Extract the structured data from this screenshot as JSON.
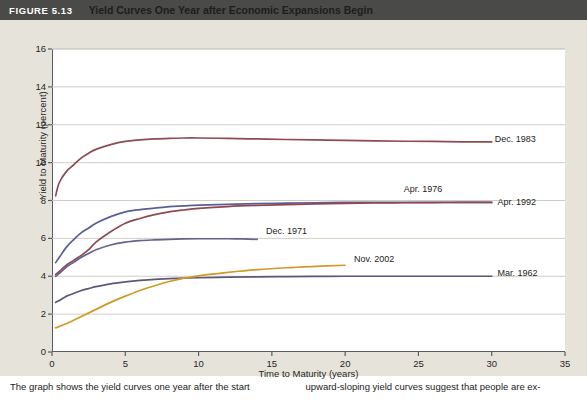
{
  "header": {
    "figure_number": "FIGURE 5.13",
    "title": "Yield Curves One Year after Economic Expansions Begin",
    "bar_color": "#4a4a48"
  },
  "caption": {
    "left": "The graph shows the yield curves one year after the start",
    "right": "upward-sloping yield curves suggest that people are ex-"
  },
  "chart_data": {
    "type": "line",
    "title": "Yield Curves One Year after Economic Expansions Begin",
    "xlabel": "Time to Maturity (years)",
    "ylabel": "Yield to Maturity (percent)",
    "xlim": [
      0,
      35
    ],
    "ylim": [
      0,
      16
    ],
    "xticks": [
      0,
      5,
      10,
      15,
      20,
      25,
      30,
      35
    ],
    "yticks": [
      0,
      2,
      4,
      6,
      8,
      10,
      12,
      14,
      16
    ],
    "grid": "horizontal",
    "legend": "inline-labels",
    "series": [
      {
        "name": "Dec. 1983",
        "color": "#8d4a52",
        "label_x": 30.2,
        "label_y": 11.2,
        "x": [
          0.25,
          0.5,
          1,
          1.5,
          2,
          2.5,
          3,
          4,
          5,
          6,
          7,
          8,
          9,
          10,
          12,
          14,
          16,
          18,
          20,
          22,
          24,
          26,
          28,
          30
        ],
        "y": [
          8.25,
          8.95,
          9.55,
          9.9,
          10.25,
          10.5,
          10.7,
          10.95,
          11.12,
          11.2,
          11.25,
          11.28,
          11.3,
          11.3,
          11.28,
          11.25,
          11.22,
          11.2,
          11.18,
          11.15,
          11.13,
          11.12,
          11.1,
          11.1
        ]
      },
      {
        "name": "Apr. 1976",
        "color": "#5b5f96",
        "label_x": 24.0,
        "label_y": 8.55,
        "x": [
          0.25,
          0.5,
          1,
          1.5,
          2,
          2.5,
          3,
          4,
          5,
          6,
          7,
          8,
          9,
          10,
          12,
          14,
          16,
          18,
          20,
          22,
          24,
          26,
          28,
          30
        ],
        "y": [
          4.72,
          5.0,
          5.55,
          5.95,
          6.3,
          6.55,
          6.8,
          7.15,
          7.4,
          7.52,
          7.6,
          7.68,
          7.72,
          7.76,
          7.8,
          7.84,
          7.86,
          7.88,
          7.9,
          7.9,
          7.9,
          7.9,
          7.9,
          7.9
        ]
      },
      {
        "name": "Apr. 1992",
        "color": "#8d4a52",
        "label_x": 30.4,
        "label_y": 7.85,
        "x": [
          0.25,
          0.5,
          1,
          1.5,
          2,
          2.5,
          3,
          4,
          5,
          6,
          7,
          8,
          9,
          10,
          12,
          14,
          16,
          18,
          20,
          22,
          24,
          26,
          28,
          30
        ],
        "y": [
          4.1,
          4.25,
          4.6,
          4.85,
          5.1,
          5.4,
          5.8,
          6.35,
          6.8,
          7.05,
          7.25,
          7.4,
          7.5,
          7.58,
          7.68,
          7.74,
          7.78,
          7.82,
          7.85,
          7.87,
          7.88,
          7.89,
          7.9,
          7.9
        ]
      },
      {
        "name": "Dec. 1971",
        "color": "#6a5f8e",
        "label_x": 14.6,
        "label_y": 6.35,
        "x": [
          0.25,
          0.5,
          1,
          1.5,
          2,
          2.5,
          3,
          4,
          5,
          6,
          7,
          8,
          9,
          10,
          11,
          12,
          13,
          14
        ],
        "y": [
          4.0,
          4.15,
          4.5,
          4.75,
          5.0,
          5.2,
          5.4,
          5.65,
          5.8,
          5.88,
          5.92,
          5.95,
          5.97,
          5.98,
          5.98,
          5.98,
          5.97,
          5.95
        ]
      },
      {
        "name": "Mar. 1962",
        "color": "#5c5878",
        "label_x": 30.4,
        "label_y": 4.1,
        "x": [
          0.25,
          0.5,
          1,
          1.5,
          2,
          2.5,
          3,
          4,
          5,
          6,
          7,
          8,
          9,
          10,
          12,
          14,
          16,
          18,
          20,
          22,
          24,
          26,
          28,
          30
        ],
        "y": [
          2.62,
          2.72,
          2.95,
          3.1,
          3.25,
          3.35,
          3.45,
          3.6,
          3.7,
          3.78,
          3.84,
          3.87,
          3.9,
          3.92,
          3.95,
          3.97,
          3.98,
          3.99,
          4.0,
          4.0,
          4.0,
          4.0,
          4.0,
          4.0
        ]
      },
      {
        "name": "Nov. 2002",
        "color": "#d09a2a",
        "label_x": 20.6,
        "label_y": 4.85,
        "x": [
          0.25,
          1,
          2,
          3,
          4,
          5,
          6,
          7,
          8,
          9,
          10,
          12,
          14,
          16,
          18,
          20
        ],
        "y": [
          1.28,
          1.5,
          1.88,
          2.25,
          2.62,
          2.95,
          3.25,
          3.5,
          3.72,
          3.9,
          4.02,
          4.2,
          4.35,
          4.45,
          4.52,
          4.58
        ]
      }
    ]
  }
}
